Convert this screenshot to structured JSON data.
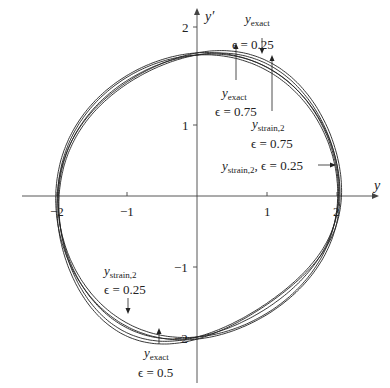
{
  "chart_data": {
    "type": "line",
    "title": "",
    "xlabel": "y",
    "ylabel": "y'",
    "xlim": [
      -2.7,
      2.7
    ],
    "ylim": [
      -2.5,
      2.6
    ],
    "x_ticks": [
      -2,
      -1,
      1,
      2
    ],
    "y_ticks": [
      -2,
      -1,
      1,
      2
    ],
    "x_tick_labels": [
      "−2",
      "−1",
      "1",
      "2"
    ],
    "y_tick_labels": [
      "−2",
      "−1",
      "1",
      "2"
    ],
    "grid": false,
    "legend": "none (curves annotated with arrows)",
    "series": [
      {
        "name": "y_exact, ε = 0.25",
        "radius": 2.0,
        "skew": 0.25
      },
      {
        "name": "y_exact, ε = 0.5",
        "radius": 2.0,
        "skew": 0.5
      },
      {
        "name": "y_exact, ε = 0.75",
        "radius": 2.0,
        "skew": 0.75
      },
      {
        "name": "y_strain,2, ε = 0.25",
        "radius": 2.03,
        "skew": 0.3
      },
      {
        "name": "y_strain,2, ε = 0.75",
        "radius": 2.03,
        "skew": 0.8
      }
    ],
    "annotations": [
      {
        "base": "y",
        "sub": "exact",
        "eps": "ϵ = 0.25",
        "position": "top-right, above curve near (0.9, 1.85)"
      },
      {
        "base": "y",
        "sub": "exact",
        "eps": "ϵ = 0.75",
        "position": "below curve near (0.5, 1.75)"
      },
      {
        "base": "y",
        "sub": "strain,2",
        "eps": "ϵ = 0.75",
        "position": "below curve near (1.1, 1.6)"
      },
      {
        "base": "y",
        "sub": "strain,2",
        "eps": "ϵ = 0.25",
        "position": "right side near (2.0, 0.55)"
      },
      {
        "base": "y",
        "sub": "strain,2",
        "eps": "ϵ = 0.25",
        "position": "lower-left near (-1.0, -1.55)"
      },
      {
        "base": "y",
        "sub": "exact",
        "eps": "ϵ = 0.5",
        "position": "bottom near (-0.6, -1.85)"
      }
    ]
  },
  "axes": {
    "x_label": "y",
    "y_label": "y′",
    "ticks": {
      "xm2": "−2",
      "xm1": "−1",
      "x1": "1",
      "x2": "2",
      "ym2": "−2",
      "ym1": "−1",
      "y1": "1",
      "y2": "2"
    }
  },
  "labels": {
    "a1": {
      "base": "y",
      "sub": "exact",
      "eps": "ϵ = 0.25"
    },
    "a2": {
      "base": "y",
      "sub": "exact",
      "eps": "ϵ = 0.75"
    },
    "a3": {
      "base": "y",
      "sub": "strain,2",
      "eps": "ϵ = 0.75"
    },
    "a4": {
      "base": "y",
      "sub": "strain,2",
      "sep": ", ",
      "eps": "ϵ = 0.25"
    },
    "a5": {
      "base": "y",
      "sub": "strain,2",
      "eps": "ϵ = 0.25"
    },
    "a6": {
      "base": "y",
      "sub": "exact",
      "eps": "ϵ = 0.5"
    }
  },
  "style": {
    "line_color": "#222222",
    "axis_color": "#444444"
  }
}
